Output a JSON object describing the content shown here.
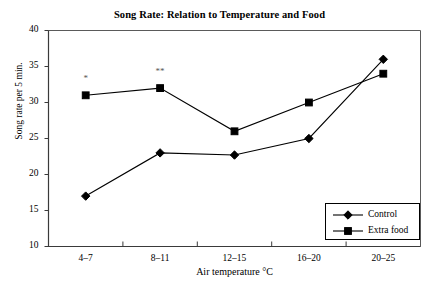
{
  "chart_data": {
    "type": "line",
    "title": "Song Rate: Relation to Temperature and Food",
    "xlabel": "Air temperature °C",
    "ylabel": "Song rate per 5 min.",
    "categories": [
      "4–7",
      "8–11",
      "12–15",
      "16–20",
      "20–25"
    ],
    "ylim": [
      10,
      40
    ],
    "yticks": [
      10,
      15,
      20,
      25,
      30,
      35,
      40
    ],
    "ytick_labels": [
      "10",
      "15",
      "20",
      "25",
      "30",
      "35",
      "40"
    ],
    "grid": false,
    "legend_position": "bottom-right",
    "series": [
      {
        "name": "Control",
        "marker": "diamond",
        "color": "#000000",
        "values": [
          17,
          23,
          22.7,
          25,
          36
        ]
      },
      {
        "name": "Extra food",
        "marker": "square",
        "color": "#000000",
        "values": [
          31,
          32,
          26,
          30,
          34
        ]
      }
    ],
    "annotations": [
      {
        "text": "*",
        "series": "Extra food",
        "category": "4–7",
        "value": 31
      },
      {
        "text": "**",
        "series": "Extra food",
        "category": "8–11",
        "value": 32
      }
    ]
  }
}
